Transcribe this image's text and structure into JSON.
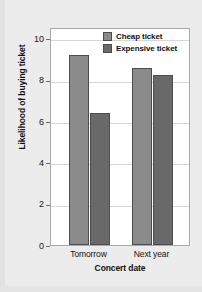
{
  "chart_data": {
    "type": "bar",
    "title": "",
    "xlabel": "Concert date",
    "ylabel": "Likelihood of buying ticket",
    "categories": [
      "Tomorrow",
      "Next year"
    ],
    "series": [
      {
        "name": "Cheap ticket",
        "values": [
          9.2,
          8.55
        ],
        "color": "#8b8b8b"
      },
      {
        "name": "Expensive ticket",
        "values": [
          6.4,
          8.25
        ],
        "color": "#696969"
      }
    ],
    "ylim": [
      0,
      10
    ],
    "yticks": [
      0,
      2,
      4,
      6,
      8,
      10
    ],
    "ytick_labels": [
      "0",
      "2",
      "4",
      "6",
      "8",
      "10"
    ],
    "grid": true,
    "legend_position": "top-right",
    "frame_color": "#a9a9aa",
    "gridline_color": "#d7d7d8",
    "background": "#ffffff",
    "page_background": "#ececed"
  }
}
